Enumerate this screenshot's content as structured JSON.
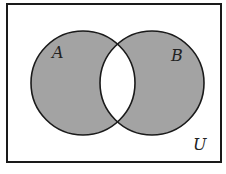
{
  "diagram": {
    "type": "venn",
    "universe_label": "U",
    "sets": [
      {
        "label": "A",
        "cx": 83,
        "cy": 83,
        "r": 52
      },
      {
        "label": "B",
        "cx": 152,
        "cy": 83,
        "r": 52
      }
    ],
    "shaded_region": "A Δ B (A ∪ B minus A ∩ B)",
    "colors": {
      "shade": "#a3a3a3",
      "stroke": "#1a1a1a",
      "background": "#ffffff"
    }
  }
}
